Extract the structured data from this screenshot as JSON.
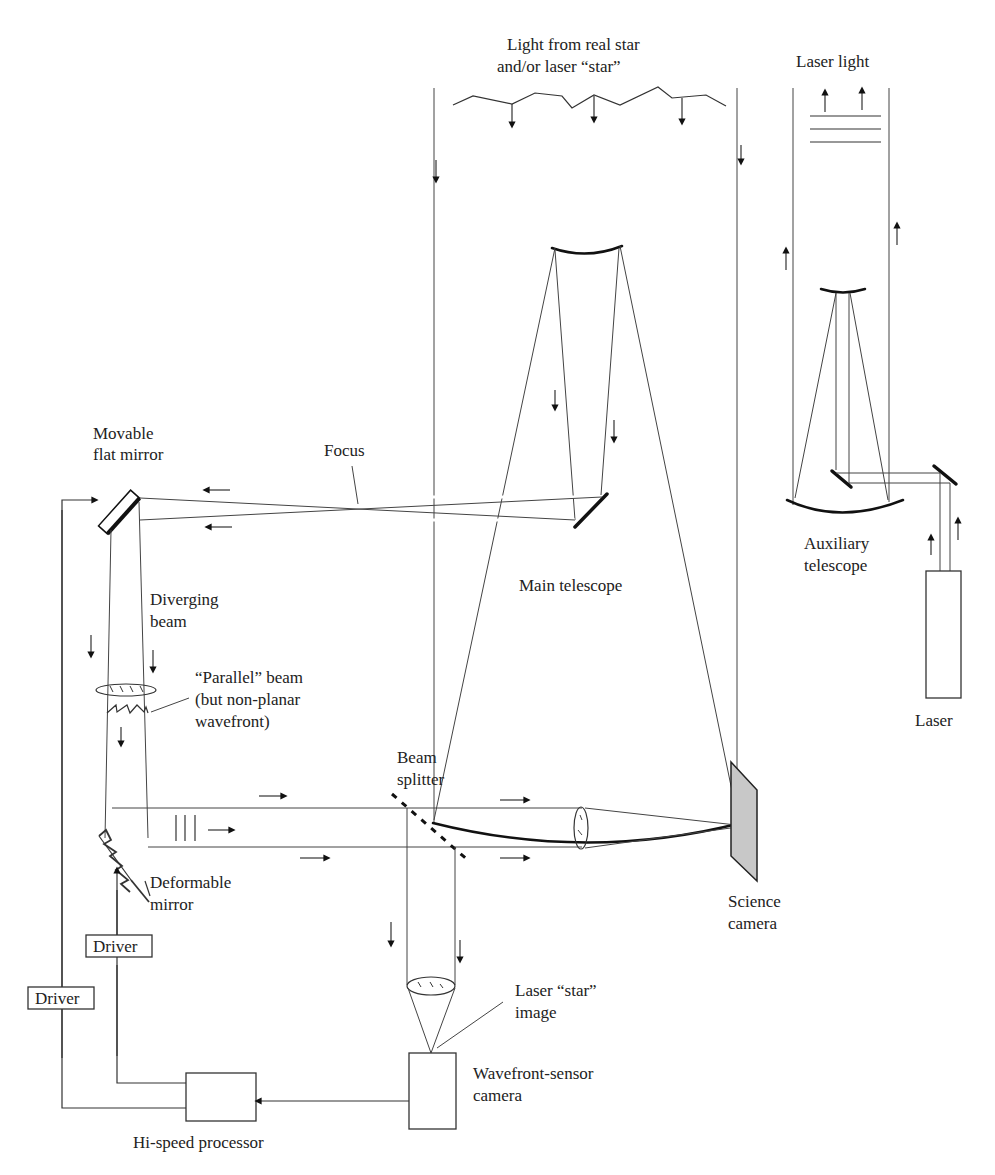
{
  "figure": {
    "background": "#ffffff",
    "line_color": "#333333",
    "camera_fill": "#c8c8c8"
  },
  "labels": {
    "incoming_light_line1": "Light from real star",
    "incoming_light_line2": "and/or laser “star”",
    "laser_light": "Laser light",
    "movable_mirror_line1": "Movable",
    "movable_mirror_line2": "flat mirror",
    "focus": "Focus",
    "main_telescope": "Main telescope",
    "auxiliary_line1": "Auxiliary",
    "auxiliary_line2": "telescope",
    "laser": "Laser",
    "diverging_line1": "Diverging",
    "diverging_line2": "beam",
    "parallel_line1": "“Parallel” beam",
    "parallel_line2": "(but non-planar",
    "parallel_line3": "wavefront)",
    "beam_splitter_line1": "Beam",
    "beam_splitter_line2": "splitter",
    "deformable_line1": "Deformable",
    "deformable_line2": "mirror",
    "science_line1": "Science",
    "science_line2": "camera",
    "laser_star_line1": "Laser “star”",
    "laser_star_line2": "image",
    "wavefront_line1": "Wavefront-sensor",
    "wavefront_line2": "camera",
    "driver_1": "Driver",
    "driver_2": "Driver",
    "processor": "Hi-speed processor"
  },
  "components": [
    "main-telescope",
    "auxiliary-telescope",
    "laser",
    "movable-flat-mirror",
    "deformable-mirror",
    "beam-splitter",
    "science-camera",
    "wavefront-sensor-camera",
    "hi-speed-processor",
    "driver-1",
    "driver-2"
  ]
}
